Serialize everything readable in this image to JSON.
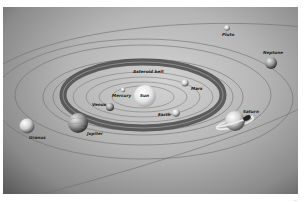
{
  "diagram": {
    "colors": {
      "background_light": "#d2d2d2",
      "background_dark": "#5a5a5a",
      "orbit": "#6e6e6e",
      "asteroid_belt": "#4a4a4a",
      "label": "#222222"
    },
    "labels": {
      "sun": "Sun",
      "mercury": "Mercury",
      "venus": "Venus",
      "earth": "Earth",
      "mars": "Mars",
      "asteroid_belt": "Asteroid belt",
      "jupiter": "Jupiter",
      "saturn": "Saturn",
      "uranus": "Uranus",
      "neptune": "Neptune",
      "pluto": "Pluto"
    },
    "corner_mark": "..."
  }
}
